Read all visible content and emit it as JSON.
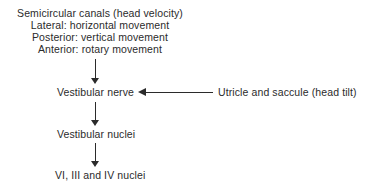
{
  "diagram": {
    "background_color": "#ffffff",
    "stroke_color": "#2b2b2b",
    "text_color": "#2b2b2b",
    "source_block": {
      "lines": [
        "Semicircular canals (head velocity)",
        "Lateral: horizontal movement",
        "Posterior: vertical movement",
        "Anterior: rotary movement"
      ]
    },
    "nodes": {
      "vestibular_nerve": "Vestibular nerve",
      "vestibular_nuclei": "Vestibular nuclei",
      "cranial_nuclei": "VI, III and IV nuclei",
      "utricle_saccule": "Utricle and saccule (head tilt)"
    },
    "edges": [
      {
        "id": "source-to-nerve",
        "from": "Semicircular canals (head velocity)",
        "to": "Vestibular nerve",
        "direction": "down",
        "arrowhead": "filled-triangle"
      },
      {
        "id": "utricle-to-nerve",
        "from": "Utricle and saccule (head tilt)",
        "to": "Vestibular nerve",
        "direction": "left",
        "arrowhead": "filled-triangle"
      },
      {
        "id": "nerve-to-nuclei",
        "from": "Vestibular nerve",
        "to": "Vestibular nuclei",
        "direction": "down",
        "arrowhead": "filled-triangle"
      },
      {
        "id": "nuclei-to-cn",
        "from": "Vestibular nuclei",
        "to": "VI, III and IV nuclei",
        "direction": "down",
        "arrowhead": "filled-triangle"
      }
    ]
  }
}
